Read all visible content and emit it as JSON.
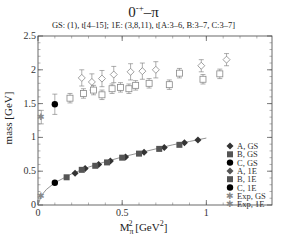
{
  "chart_data": {
    "type": "scatter",
    "title_text": "0",
    "title_sup": "-+",
    "title_suffix": "–π",
    "subtitle": "GS: (1), t[4–15];    1E: (3,8,11), t[A:3–6, B:3–7, C:3–7]",
    "xlabel": "M_π^2 [GeV^2]",
    "xlabel_main": "M",
    "xlabel_sub": "π",
    "xlabel_sup": "2",
    "xlabel_unit": "[GeV",
    "xlabel_unit_sup": "2",
    "xlabel_close": "]",
    "ylabel": "mass [GeV]",
    "xlim": [
      0,
      1.39
    ],
    "ylim": [
      0,
      2.5
    ],
    "xticks": [
      0,
      0.5,
      1
    ],
    "xtick_labels": [
      "0",
      "0.5",
      "1"
    ],
    "yticks": [
      0,
      0.5,
      1,
      1.5,
      2,
      2.5
    ],
    "ytick_labels": [
      "0",
      "0.5",
      "1",
      "1.5",
      "2",
      "2.5"
    ],
    "grid": false,
    "legend_position": "lower right",
    "series": [
      {
        "name": "A, GS",
        "marker": "diamond",
        "fill": "#333",
        "x": [
          0.22,
          0.28,
          0.36,
          0.43,
          0.52,
          0.63,
          0.75,
          0.87,
          0.95
        ],
        "y": [
          0.47,
          0.54,
          0.6,
          0.65,
          0.71,
          0.78,
          0.85,
          0.92,
          0.96
        ],
        "yerr": [
          0.01,
          0.01,
          0.01,
          0.01,
          0.01,
          0.01,
          0.01,
          0.01,
          0.01
        ]
      },
      {
        "name": "B, GS",
        "marker": "square",
        "fill": "#555",
        "x": [
          0.17,
          0.26,
          0.34,
          0.41,
          0.5,
          0.6,
          0.72,
          0.84
        ],
        "y": [
          0.41,
          0.52,
          0.58,
          0.63,
          0.7,
          0.76,
          0.83,
          0.89
        ],
        "yerr": [
          0.01,
          0.01,
          0.01,
          0.01,
          0.01,
          0.01,
          0.01,
          0.01
        ]
      },
      {
        "name": "C, GS",
        "marker": "circle",
        "fill": "#000",
        "x": [
          0.1
        ],
        "y": [
          0.33
        ],
        "yerr": [
          0.01
        ]
      },
      {
        "name": "A, 1E",
        "marker": "diamond-open",
        "fill": "#888",
        "x": [
          0.26,
          0.32,
          0.38,
          0.45,
          0.55,
          0.62,
          0.7,
          0.97,
          1.12
        ],
        "y": [
          1.88,
          1.82,
          1.87,
          1.93,
          1.97,
          1.98,
          2.0,
          2.06,
          2.15
        ],
        "yerr": [
          0.12,
          0.12,
          0.12,
          0.12,
          0.12,
          0.12,
          0.12,
          0.09,
          0.09
        ]
      },
      {
        "name": "B, 1E",
        "marker": "square-open",
        "fill": "#888",
        "x": [
          0.19,
          0.27,
          0.33,
          0.38,
          0.44,
          0.49,
          0.54,
          0.58,
          0.66,
          0.78,
          0.84,
          0.98,
          1.08
        ],
        "y": [
          1.58,
          1.65,
          1.7,
          1.63,
          1.72,
          1.74,
          1.72,
          1.77,
          1.8,
          1.78,
          1.95,
          1.86,
          1.94
        ],
        "yerr": [
          0.07,
          0.07,
          0.07,
          0.07,
          0.07,
          0.07,
          0.07,
          0.07,
          0.07,
          0.07,
          0.07,
          0.07,
          0.07
        ]
      },
      {
        "name": "C, 1E",
        "marker": "circle",
        "fill": "#000",
        "x": [
          0.1
        ],
        "y": [
          1.49
        ],
        "yerr": [
          0.15
        ]
      },
      {
        "name": "Exp, GS",
        "marker": "star",
        "fill": "#888",
        "x": [
          0.0195
        ],
        "y": [
          0.14
        ],
        "yerr": [
          0
        ]
      },
      {
        "name": "Exp, 1E",
        "marker": "star",
        "fill": "#888",
        "x": [
          0.0195
        ],
        "y": [
          1.3
        ],
        "yerr": [
          0.1
        ]
      }
    ],
    "fit_curve": {
      "description": "sqrt-like fit through GS points",
      "x": [
        0,
        0.02,
        0.05,
        0.1,
        0.2,
        0.3,
        0.4,
        0.5,
        0.6,
        0.7,
        0.8,
        0.9,
        1.0
      ],
      "y": [
        0,
        0.14,
        0.23,
        0.33,
        0.46,
        0.56,
        0.64,
        0.71,
        0.77,
        0.83,
        0.89,
        0.94,
        0.99
      ]
    }
  }
}
